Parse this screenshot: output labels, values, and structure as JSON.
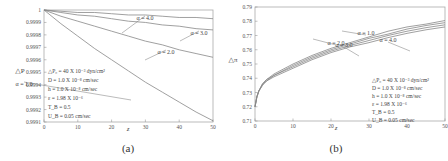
{
  "chart_data": [
    {
      "id": "a",
      "type": "line",
      "caption": "(a)",
      "xlabel": "z",
      "ylabel": "△P",
      "xlim": [
        0,
        50
      ],
      "ylim": [
        0.9991,
        1.0
      ],
      "xticks": [
        "0",
        "10",
        "20",
        "30",
        "40",
        "50"
      ],
      "yticks": [
        "0.9991",
        "0.9992",
        "0.9993",
        "0.9994",
        "0.9995",
        "0.9996",
        "0.9997",
        "0.9998",
        "0.9999",
        "1"
      ],
      "grid": false,
      "series": [
        {
          "name": "α = 1.0",
          "x": [
            0,
            5,
            10,
            15,
            20,
            25,
            30,
            35,
            40,
            45,
            50
          ],
          "values": [
            1.0,
            0.99989,
            0.99979,
            0.99969,
            0.9996,
            0.99951,
            0.99942,
            0.99934,
            0.99926,
            0.99918,
            0.99911
          ]
        },
        {
          "name": "α = 2.0",
          "x": [
            0,
            5,
            10,
            15,
            20,
            25,
            30,
            35,
            40,
            45,
            50
          ],
          "values": [
            1.0,
            0.99995,
            0.99991,
            0.99987,
            0.99983,
            0.99979,
            0.99975,
            0.99972,
            0.99968,
            0.99965,
            0.99962
          ]
        },
        {
          "name": "α = 3.0",
          "x": [
            0,
            5,
            10,
            15,
            20,
            25,
            30,
            35,
            40,
            45,
            50
          ],
          "values": [
            1.0,
            0.99998,
            0.99996,
            0.99995,
            0.99993,
            0.99991,
            0.9999,
            0.99988,
            0.99987,
            0.99985,
            0.99984
          ]
        },
        {
          "name": "α = 4.0",
          "x": [
            0,
            5,
            10,
            15,
            20,
            25,
            30,
            35,
            40,
            45,
            50
          ],
          "values": [
            1.0,
            0.99999,
            0.99998,
            0.99998,
            0.99997,
            0.99996,
            0.99996,
            0.99995,
            0.99994,
            0.99994,
            0.99993
          ]
        }
      ],
      "annotations": [
        "△P₀ = 40 X 10⁻³ dyn/cm²",
        "D = 1.0 X 10⁻⁸ cm/sec",
        "h = 1.0 X 10⁻⁸ cm/sec",
        "ε = 1.98 X 10⁻⁶",
        "T_B = 0.5",
        "U_B = 0.05 cm/sec"
      ]
    },
    {
      "id": "b",
      "type": "line",
      "caption": "(b)",
      "xlabel": "z",
      "ylabel": "△π",
      "xlim": [
        0,
        50
      ],
      "ylim": [
        0.71,
        0.79
      ],
      "xticks": [
        "0",
        "10",
        "20",
        "30",
        "40",
        "50"
      ],
      "yticks": [
        "0.71",
        "0.72",
        "0.73",
        "0.74",
        "0.75",
        "0.76",
        "0.77",
        "0.78",
        "0.79"
      ],
      "grid": false,
      "series": [
        {
          "name": "α = 1.0",
          "x": [
            0,
            0.5,
            1,
            2,
            3,
            5,
            10,
            15,
            20,
            25,
            30,
            35,
            40,
            45,
            50
          ],
          "values": [
            0.72,
            0.727,
            0.731,
            0.736,
            0.739,
            0.743,
            0.75,
            0.756,
            0.761,
            0.765,
            0.769,
            0.773,
            0.776,
            0.778,
            0.7805
          ]
        },
        {
          "name": "α = 2.0",
          "x": [
            0,
            0.5,
            1,
            2,
            3,
            5,
            10,
            15,
            20,
            25,
            30,
            35,
            40,
            45,
            50
          ],
          "values": [
            0.72,
            0.727,
            0.731,
            0.736,
            0.739,
            0.742,
            0.749,
            0.755,
            0.76,
            0.764,
            0.768,
            0.771,
            0.7745,
            0.777,
            0.779
          ]
        },
        {
          "name": "α = 3.0",
          "x": [
            0,
            0.5,
            1,
            2,
            3,
            5,
            10,
            15,
            20,
            25,
            30,
            35,
            40,
            45,
            50
          ],
          "values": [
            0.72,
            0.727,
            0.731,
            0.736,
            0.738,
            0.742,
            0.748,
            0.754,
            0.759,
            0.763,
            0.7665,
            0.77,
            0.773,
            0.7755,
            0.7775
          ]
        },
        {
          "name": "α = 4.0",
          "x": [
            0,
            0.5,
            1,
            2,
            3,
            5,
            10,
            15,
            20,
            25,
            30,
            35,
            40,
            45,
            50
          ],
          "values": [
            0.72,
            0.727,
            0.731,
            0.735,
            0.738,
            0.741,
            0.747,
            0.753,
            0.758,
            0.762,
            0.765,
            0.7685,
            0.7715,
            0.774,
            0.776
          ]
        }
      ],
      "annotations": [
        "△P₀ = 40 X 10⁻³ dyn/cm²",
        "D = 1.0 X 10⁻⁸ cm/sec",
        "h = 1.0 X 10⁻⁸ cm/sec",
        "ε = 1.98 X 10⁻⁶",
        "T_B = 0.5",
        "U_B = 0.05 cm/sec"
      ]
    }
  ],
  "layout": {
    "a": {
      "left": 44,
      "top": 10,
      "right": 213,
      "bottom": 122,
      "label_pos": [
        [
          131,
          100,
          24,
          82
        ],
        [
          145,
          60,
          166,
          50
        ],
        [
          180,
          41,
          199,
          31
        ],
        [
          122,
          33,
          145,
          16
        ]
      ],
      "ann_x": 48,
      "ann_y0": 73,
      "ann_dy": 9,
      "caption_xy": [
        128,
        152
      ],
      "ylabel_xy": [
        20,
        73
      ],
      "xlabel_xy": [
        128,
        131
      ]
    },
    "b": {
      "left": 255,
      "top": 7,
      "right": 445,
      "bottom": 121,
      "label_pos": [
        [
          342,
          31,
          366,
          35
        ],
        [
          313,
          39,
          336,
          45
        ],
        [
          359,
          56,
          344,
          47
        ],
        [
          410,
          51,
          388,
          42
        ]
      ],
      "ann_x": 372,
      "ann_y0": 82,
      "ann_dy": 8,
      "caption_xy": [
        336,
        152
      ],
      "ylabel_xy": [
        233,
        62
      ],
      "xlabel_xy": [
        336,
        130
      ]
    }
  }
}
